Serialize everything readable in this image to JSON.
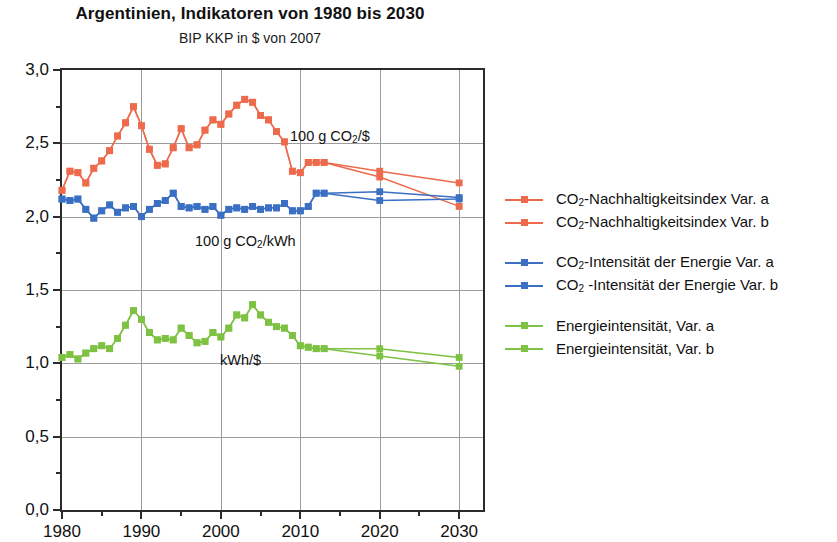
{
  "header": {
    "title": "Argentinien, Indikatoren von 1980 bis 2030",
    "subtitle": "BIP KKP in $ von 2007"
  },
  "colors": {
    "red": "#ED6B4C",
    "blue": "#3A6FC4",
    "green": "#7DC242",
    "axis": "#2b2b2b",
    "grid": "#9c9c9c"
  },
  "annotations": [
    {
      "id": "co2-per-dollar",
      "text_prefix": "100 g CO",
      "sub": "2",
      "text_suffix": "/$",
      "x": 288,
      "y": 126
    },
    {
      "id": "co2-per-kwh",
      "text_prefix": "100 g CO",
      "sub": "2",
      "text_suffix": "/kWh",
      "x": 193,
      "y": 231
    },
    {
      "id": "kwh-per-dollar",
      "text_prefix": "kWh/$",
      "sub": "",
      "text_suffix": "",
      "x": 218,
      "y": 350
    }
  ],
  "legend": {
    "groups": [
      {
        "color_key": "red",
        "entries": [
          {
            "prefix": "CO",
            "sub": "2",
            "suffix": "-Nachhaltigkeitsindex Var. a"
          },
          {
            "prefix": "CO",
            "sub": "2",
            "suffix": "-Nachhaltigkeitsindex Var. b"
          }
        ]
      },
      {
        "color_key": "blue",
        "entries": [
          {
            "prefix": "CO",
            "sub": "2",
            "suffix": "-Intensität der Energie Var. a"
          },
          {
            "prefix": "CO",
            "sub": "2",
            "suffix": " -Intensität der Energie Var. b"
          }
        ]
      },
      {
        "color_key": "green",
        "entries": [
          {
            "prefix": "Energieintensität, Var. a",
            "sub": "",
            "suffix": ""
          },
          {
            "prefix": "Energieintensität, Var. b",
            "sub": "",
            "suffix": ""
          }
        ]
      }
    ]
  },
  "chart_data": {
    "type": "line",
    "title": "Argentinien, Indikatoren von 1980 bis 2030",
    "subtitle": "BIP KKP in $ von 2007",
    "xlabel": "",
    "ylabel": "",
    "xlim": [
      1980,
      2033
    ],
    "ylim": [
      0.0,
      3.0
    ],
    "ytick_labels": [
      "0,0",
      "0,5",
      "1,0",
      "1,5",
      "2,0",
      "2,5",
      "3,0"
    ],
    "ytick_values": [
      0.0,
      0.5,
      1.0,
      1.5,
      2.0,
      2.5,
      3.0
    ],
    "ytick_minor": [
      0.25,
      0.75,
      1.25,
      1.75,
      2.25,
      2.75
    ],
    "xtick_labels": [
      "1980",
      "1990",
      "2000",
      "2010",
      "2020",
      "2030"
    ],
    "xtick_values": [
      1980,
      1990,
      2000,
      2010,
      2020,
      2030
    ],
    "xtick_minor": [
      1985,
      1995,
      2005,
      2015,
      2025
    ],
    "grid": true,
    "legend_position": "right",
    "series": [
      {
        "name": "CO2-Nachhaltigkeitsindex Var. a",
        "color_key": "red",
        "x": [
          1980,
          1981,
          1982,
          1983,
          1984,
          1985,
          1986,
          1987,
          1988,
          1989,
          1990,
          1991,
          1992,
          1993,
          1994,
          1995,
          1996,
          1997,
          1998,
          1999,
          2000,
          2001,
          2002,
          2003,
          2004,
          2005,
          2006,
          2007,
          2008,
          2009,
          2010,
          2011,
          2012,
          2013,
          2020,
          2030
        ],
        "y": [
          2.18,
          2.31,
          2.3,
          2.23,
          2.33,
          2.38,
          2.45,
          2.55,
          2.64,
          2.75,
          2.62,
          2.46,
          2.35,
          2.36,
          2.47,
          2.6,
          2.47,
          2.49,
          2.59,
          2.66,
          2.63,
          2.7,
          2.76,
          2.8,
          2.78,
          2.69,
          2.66,
          2.58,
          2.51,
          2.31,
          2.3,
          2.37,
          2.37,
          2.37,
          2.31,
          2.23
        ]
      },
      {
        "name": "CO2-Nachhaltigkeitsindex Var. b",
        "color_key": "red",
        "x": [
          1980,
          1981,
          1982,
          1983,
          1984,
          1985,
          1986,
          1987,
          1988,
          1989,
          1990,
          1991,
          1992,
          1993,
          1994,
          1995,
          1996,
          1997,
          1998,
          1999,
          2000,
          2001,
          2002,
          2003,
          2004,
          2005,
          2006,
          2007,
          2008,
          2009,
          2010,
          2011,
          2012,
          2013,
          2020,
          2030
        ],
        "y": [
          2.18,
          2.31,
          2.3,
          2.23,
          2.33,
          2.38,
          2.45,
          2.55,
          2.64,
          2.75,
          2.62,
          2.46,
          2.35,
          2.36,
          2.47,
          2.6,
          2.47,
          2.49,
          2.59,
          2.66,
          2.63,
          2.7,
          2.76,
          2.8,
          2.78,
          2.69,
          2.66,
          2.58,
          2.51,
          2.31,
          2.3,
          2.37,
          2.37,
          2.37,
          2.27,
          2.07
        ]
      },
      {
        "name": "CO2-Intensität der Energie Var. a",
        "color_key": "blue",
        "x": [
          1980,
          1981,
          1982,
          1983,
          1984,
          1985,
          1986,
          1987,
          1988,
          1989,
          1990,
          1991,
          1992,
          1993,
          1994,
          1995,
          1996,
          1997,
          1998,
          1999,
          2000,
          2001,
          2002,
          2003,
          2004,
          2005,
          2006,
          2007,
          2008,
          2009,
          2010,
          2011,
          2012,
          2013,
          2020,
          2030
        ],
        "y": [
          2.12,
          2.11,
          2.12,
          2.05,
          1.99,
          2.04,
          2.08,
          2.03,
          2.06,
          2.07,
          2.0,
          2.05,
          2.09,
          2.11,
          2.16,
          2.07,
          2.06,
          2.07,
          2.05,
          2.07,
          2.01,
          2.05,
          2.06,
          2.05,
          2.07,
          2.05,
          2.06,
          2.06,
          2.09,
          2.04,
          2.04,
          2.07,
          2.16,
          2.16,
          2.17,
          2.13
        ]
      },
      {
        "name": "CO2-Intensität der Energie Var. b",
        "color_key": "blue",
        "x": [
          1980,
          1981,
          1982,
          1983,
          1984,
          1985,
          1986,
          1987,
          1988,
          1989,
          1990,
          1991,
          1992,
          1993,
          1994,
          1995,
          1996,
          1997,
          1998,
          1999,
          2000,
          2001,
          2002,
          2003,
          2004,
          2005,
          2006,
          2007,
          2008,
          2009,
          2010,
          2011,
          2012,
          2013,
          2020,
          2030
        ],
        "y": [
          2.12,
          2.11,
          2.12,
          2.05,
          1.99,
          2.04,
          2.08,
          2.03,
          2.06,
          2.07,
          2.0,
          2.05,
          2.09,
          2.11,
          2.16,
          2.07,
          2.06,
          2.07,
          2.05,
          2.07,
          2.01,
          2.05,
          2.06,
          2.05,
          2.07,
          2.05,
          2.06,
          2.06,
          2.09,
          2.04,
          2.04,
          2.07,
          2.16,
          2.16,
          2.11,
          2.12
        ]
      },
      {
        "name": "Energieintensität, Var. a",
        "color_key": "green",
        "x": [
          1980,
          1981,
          1982,
          1983,
          1984,
          1985,
          1986,
          1987,
          1988,
          1989,
          1990,
          1991,
          1992,
          1993,
          1994,
          1995,
          1996,
          1997,
          1998,
          1999,
          2000,
          2001,
          2002,
          2003,
          2004,
          2005,
          2006,
          2007,
          2008,
          2009,
          2010,
          2011,
          2012,
          2013,
          2020,
          2030
        ],
        "y": [
          1.04,
          1.06,
          1.03,
          1.07,
          1.1,
          1.12,
          1.1,
          1.17,
          1.26,
          1.36,
          1.3,
          1.21,
          1.16,
          1.17,
          1.16,
          1.24,
          1.19,
          1.14,
          1.15,
          1.21,
          1.18,
          1.24,
          1.33,
          1.31,
          1.4,
          1.33,
          1.28,
          1.25,
          1.24,
          1.19,
          1.12,
          1.11,
          1.1,
          1.1,
          1.1,
          1.04
        ]
      },
      {
        "name": "Energieintensität, Var. b",
        "color_key": "green",
        "x": [
          1980,
          1981,
          1982,
          1983,
          1984,
          1985,
          1986,
          1987,
          1988,
          1989,
          1990,
          1991,
          1992,
          1993,
          1994,
          1995,
          1996,
          1997,
          1998,
          1999,
          2000,
          2001,
          2002,
          2003,
          2004,
          2005,
          2006,
          2007,
          2008,
          2009,
          2010,
          2011,
          2012,
          2013,
          2020,
          2030
        ],
        "y": [
          1.04,
          1.06,
          1.03,
          1.07,
          1.1,
          1.12,
          1.1,
          1.17,
          1.26,
          1.36,
          1.3,
          1.21,
          1.16,
          1.17,
          1.16,
          1.24,
          1.19,
          1.14,
          1.15,
          1.21,
          1.18,
          1.24,
          1.33,
          1.31,
          1.4,
          1.33,
          1.28,
          1.25,
          1.24,
          1.19,
          1.12,
          1.11,
          1.1,
          1.1,
          1.05,
          0.98
        ]
      }
    ]
  }
}
